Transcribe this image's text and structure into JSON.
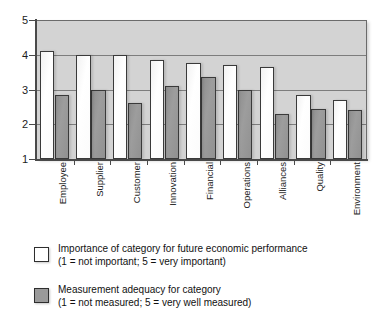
{
  "chart_data": {
    "type": "bar",
    "title": "",
    "subtitle": "",
    "xlabel": "",
    "ylabel": "",
    "ylim": [
      1,
      5
    ],
    "yticks": [
      1,
      2,
      3,
      4,
      5
    ],
    "ytick_labels": [
      "1",
      "2",
      "3",
      "4",
      "5"
    ],
    "grid": true,
    "gridlines_at": [
      2,
      3,
      4
    ],
    "legend_position": "below",
    "categories": [
      "Employee",
      "Supplier",
      "Customer",
      "Innovation",
      "Financial",
      "Operations",
      "Alliances",
      "Quality",
      "Environment"
    ],
    "series": [
      {
        "name": "Importance of category for future economic performance",
        "key": "importance",
        "color": "#ffffff",
        "values": [
          4.1,
          4.0,
          4.0,
          3.85,
          3.75,
          3.7,
          3.65,
          2.85,
          2.7
        ]
      },
      {
        "name": "Measurement adequacy for category",
        "key": "adequacy",
        "color": "#9a9a9a",
        "values": [
          2.85,
          3.0,
          2.6,
          3.1,
          3.35,
          3.0,
          2.3,
          2.45,
          2.4
        ]
      }
    ]
  },
  "legend": {
    "items": [
      {
        "swatch_name": "legend-swatch-importance",
        "line1": "Importance of category for future economic performance",
        "line2": "(1 = not important; 5 = very important)"
      },
      {
        "swatch_name": "legend-swatch-adequacy",
        "line1": "Measurement adequacy for category",
        "line2": "(1 = not measured; 5 = very well measured)"
      }
    ]
  }
}
